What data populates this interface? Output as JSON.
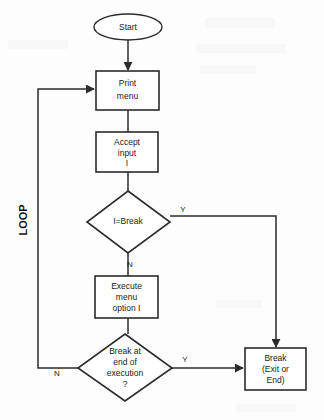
{
  "diagram": {
    "colors": {
      "stroke": "#2b2b2b",
      "text": "#1a1a1a",
      "background": "#fdfdfd",
      "shape_fill": "#ffffff"
    },
    "nodes": {
      "start": {
        "label": "Start",
        "shape": "oval"
      },
      "print_menu": {
        "line1": "Print",
        "line2": "menu",
        "shape": "process"
      },
      "accept_input": {
        "line1": "Accept",
        "line2": "input",
        "line3": "I",
        "shape": "process"
      },
      "decision_break": {
        "label": "I=Break",
        "shape": "decision"
      },
      "execute_option": {
        "line1": "Execute",
        "line2": "menu",
        "line3": "option I",
        "shape": "process"
      },
      "decision_end": {
        "line1": "Break at",
        "line2": "end of",
        "line3": "execution",
        "line4": "?",
        "shape": "decision"
      },
      "break_exit": {
        "line1": "Break",
        "line2": "(Exit or",
        "line3": "End)",
        "shape": "process"
      }
    },
    "edge_labels": {
      "break_yes": "Y",
      "break_no": "N",
      "end_yes": "Y",
      "end_no": "N"
    },
    "annotations": {
      "loop": "LOOP"
    }
  }
}
